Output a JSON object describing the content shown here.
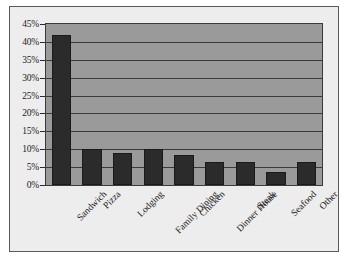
{
  "chart_data": {
    "type": "bar",
    "title": "",
    "subtitle": "",
    "xlabel": "",
    "ylabel": "",
    "categories": [
      "Sandwich",
      "Pizza",
      "Lodging",
      "Family Dining",
      "Chicken",
      "Dinner House",
      "Steak",
      "Seafood",
      "Other"
    ],
    "values": [
      42,
      10,
      9,
      10,
      8.4,
      6.3,
      6.3,
      3.6,
      6.3
    ],
    "value_suffix": "%",
    "ylim": [
      0,
      45
    ],
    "ytick_step": 5,
    "ytick_labels": [
      "0%",
      "5%",
      "10%",
      "15%",
      "20%",
      "25%",
      "30%",
      "35%",
      "40%",
      "45%"
    ],
    "ytick_values": [
      0,
      5,
      10,
      15,
      20,
      25,
      30,
      35,
      40,
      45
    ],
    "grid": true,
    "grid_axis": "y",
    "legend": false,
    "legend_position": "none",
    "orientation": "vertical",
    "xtick_rotation": -45
  },
  "style": {
    "plot_background": "#9a9a9a",
    "canvas_background": "#ededed",
    "bar_color": "#2b2b2b",
    "gridline_color": "#3a3a3a",
    "axis_color": "#2a2a2a",
    "text_color": "#1c1c1c",
    "frame_color": "#5a5a5a",
    "page_background": "#ffffff"
  }
}
